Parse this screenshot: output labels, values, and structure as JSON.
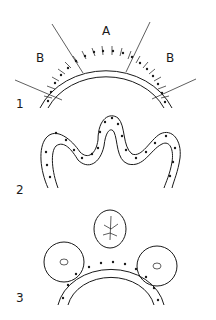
{
  "figure": {
    "panels": [
      {
        "number": "1",
        "regions": [
          {
            "label": "B",
            "side": "left"
          },
          {
            "label": "A",
            "side": "top"
          },
          {
            "label": "B",
            "side": "right"
          }
        ],
        "description": "curved epithelial layer divided into regions A and B"
      },
      {
        "number": "2",
        "description": "folded epithelial layer forming a central bud/fold"
      },
      {
        "number": "3",
        "description": "curved epithelium with two rosette clusters and a detached vesicle above"
      }
    ],
    "colors": {
      "ink": "#1a1a1a",
      "background": "#ffffff"
    }
  }
}
